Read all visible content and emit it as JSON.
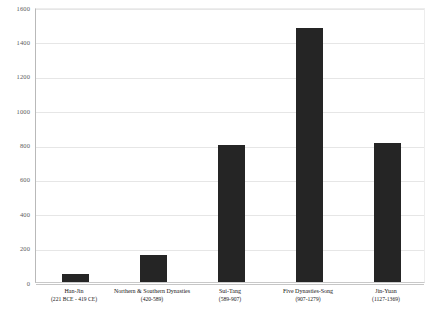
{
  "chart_data": {
    "type": "bar",
    "title": "",
    "subtitle": "",
    "xlabel": "",
    "ylabel": "",
    "categories": [
      "Han-Jin",
      "Northern & Southern Dynasties",
      "Sui-Tang",
      "Five Dynasties-Song",
      "Jin-Yuan"
    ],
    "category_periods": [
      "(221 BCE - 419 CE)",
      "(420-589)",
      "(589-907)",
      "(907-1279)",
      "(1127-1369)"
    ],
    "values": [
      45,
      160,
      800,
      1480,
      810
    ],
    "ylim": [
      0,
      1600
    ],
    "yticks": [
      0,
      200,
      400,
      600,
      800,
      1000,
      1200,
      1400,
      1600
    ],
    "ytick_labels": [
      "0",
      "200",
      "400",
      "600",
      "800",
      "1000",
      "1200",
      "1400",
      "1600"
    ],
    "grid": true,
    "legend": false,
    "legend_position": "none",
    "bar_color": "#252525",
    "gridline_color": "#e6e6e6",
    "axis_color": "#b9b9b9",
    "background_color": "#ffffff"
  }
}
